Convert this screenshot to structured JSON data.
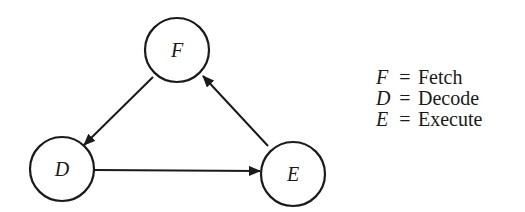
{
  "diagram": {
    "type": "state-cycle",
    "nodes": [
      {
        "id": "F",
        "label": "F",
        "cx": 177,
        "cy": 50
      },
      {
        "id": "D",
        "label": "D",
        "cx": 62,
        "cy": 169
      },
      {
        "id": "E",
        "label": "E",
        "cx": 293,
        "cy": 174
      }
    ],
    "edges": [
      {
        "from": "F",
        "to": "D"
      },
      {
        "from": "D",
        "to": "E"
      },
      {
        "from": "E",
        "to": "F"
      }
    ],
    "stroke_color": "#1a1a1a"
  },
  "legend": {
    "items": [
      {
        "symbol": "F",
        "equals": "=",
        "meaning": "Fetch"
      },
      {
        "symbol": "D",
        "equals": "=",
        "meaning": "Decode"
      },
      {
        "symbol": "E",
        "equals": "=",
        "meaning": "Execute"
      }
    ]
  }
}
